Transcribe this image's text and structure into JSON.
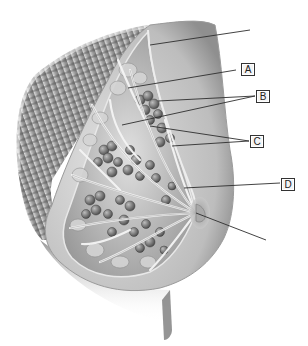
{
  "figure": {
    "type": "anatomical-illustration",
    "background": "#ffffff",
    "tones": {
      "skin": "#c9c9c9",
      "shadow": "#6e6e6e",
      "lobule": "#8a8a8a",
      "fat": "#d8d8d8",
      "duct": "#f2f2f2",
      "muscle": "#7a7a7a",
      "line": "#333333"
    }
  },
  "labels": [
    {
      "id": "A",
      "text": "A",
      "x": 246,
      "y": 63
    },
    {
      "id": "B",
      "text": "B",
      "x": 257,
      "y": 91
    },
    {
      "id": "C",
      "text": "C",
      "x": 251,
      "y": 137
    },
    {
      "id": "D",
      "text": "D",
      "x": 283,
      "y": 180
    }
  ],
  "leader_lines": [
    {
      "target": "unlabeled-top",
      "x1": 250,
      "y1": 30,
      "x2": 150,
      "y2": 45
    },
    {
      "target": "A",
      "x1": 236,
      "y1": 70,
      "x2": 128,
      "y2": 88
    },
    {
      "target": "B",
      "x1": 255,
      "y1": 96,
      "x2": 158,
      "y2": 101
    },
    {
      "target": "B",
      "x1": 255,
      "y1": 96,
      "x2": 122,
      "y2": 125
    },
    {
      "target": "C",
      "x1": 249,
      "y1": 141,
      "x2": 150,
      "y2": 126
    },
    {
      "target": "C",
      "x1": 249,
      "y1": 141,
      "x2": 172,
      "y2": 146
    },
    {
      "target": "D",
      "x1": 280,
      "y1": 183,
      "x2": 184,
      "y2": 188
    },
    {
      "target": "unlabeled-bottom",
      "x1": 266,
      "y1": 240,
      "x2": 196,
      "y2": 213
    }
  ]
}
